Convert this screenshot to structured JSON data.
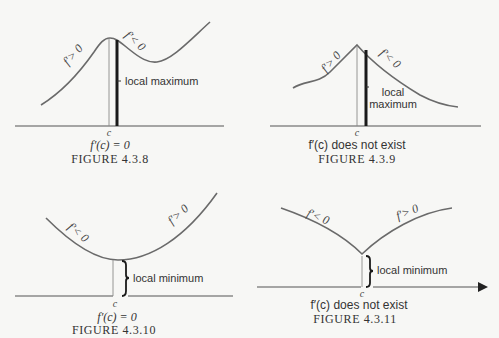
{
  "figures": [
    {
      "id": "4.3.8",
      "caption": "FIGURE 4.3.8",
      "condition": "f′(c) = 0",
      "point_label": "c",
      "left_slope_label": "f′> 0",
      "right_slope_label": "f′< 0",
      "extremum_label": "local maximum",
      "shape": "smooth peak"
    },
    {
      "id": "4.3.9",
      "caption": "FIGURE 4.3.9",
      "condition": "f′(c) does not exist",
      "point_label": "c",
      "left_slope_label": "f′> 0",
      "right_slope_label": "f′< 0",
      "extremum_label_line1": "local",
      "extremum_label_line2": "maximum",
      "shape": "cusp peak"
    },
    {
      "id": "4.3.10",
      "caption": "FIGURE 4.3.10",
      "condition": "f′(c) = 0",
      "point_label": "c",
      "left_slope_label": "f′< 0",
      "right_slope_label": "f′> 0",
      "extremum_label": "local minimum",
      "shape": "smooth valley"
    },
    {
      "id": "4.3.11",
      "caption": "FIGURE 4.3.11",
      "condition": "f′(c) does not exist",
      "point_label": "c",
      "left_slope_label": "f′< 0",
      "right_slope_label": "f′> 0",
      "extremum_label": "local minimum",
      "shape": "cusp valley"
    }
  ]
}
